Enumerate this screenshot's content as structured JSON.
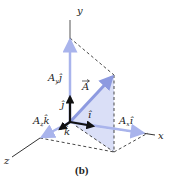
{
  "figure": {
    "caption": "(b)",
    "axes": {
      "x_label": "x",
      "y_label": "y",
      "z_label": "z"
    },
    "vectors": {
      "A_label": "A",
      "Ax_label": "A",
      "Ax_sub": "x",
      "Ax_unit": "î",
      "Ay_label": "A",
      "Ay_sub": "y",
      "Ay_unit": "ĵ",
      "Az_label": "A",
      "Az_sub": "z",
      "Az_unit": "k̂"
    },
    "unit_vectors": {
      "i": "î",
      "j": "ĵ",
      "k": "k̂"
    },
    "colors": {
      "component_arrow": "#a9b4ec",
      "vector_A": "#8d9ae0",
      "shaded_plane": "#d6dbf6",
      "unit_vector": "#111111",
      "axis": "#333333",
      "dashed": "#333333"
    }
  }
}
